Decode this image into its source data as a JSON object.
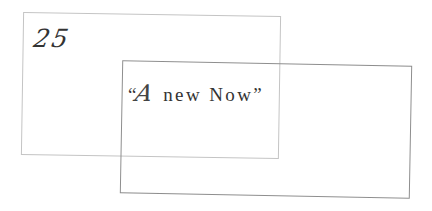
{
  "cards": {
    "back": {
      "number": "25",
      "border_color": "#c4c4c4"
    },
    "front": {
      "quote_open": "“",
      "quote_initial": "A",
      "quote_rest": " new Now",
      "quote_close": "”",
      "border_color": "#8e8e8e"
    }
  }
}
